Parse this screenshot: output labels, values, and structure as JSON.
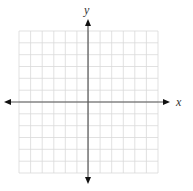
{
  "diagram": {
    "type": "coordinate-plane",
    "x_axis_label": "x",
    "y_axis_label": "y",
    "grid": {
      "columns": 12,
      "rows": 12,
      "left": 19,
      "top": 31,
      "right": 158,
      "bottom": 173,
      "line_color": "#d9d9d9"
    },
    "axes": {
      "origin_x": 88,
      "origin_y": 102,
      "x_start": 4,
      "x_end": 170,
      "y_start": 19,
      "y_end": 184,
      "color": "#555555"
    }
  }
}
